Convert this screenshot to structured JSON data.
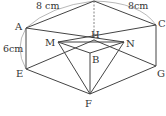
{
  "figure": {
    "type": "geometry-diagram",
    "points": {
      "A": {
        "label": "A",
        "x": 26,
        "y": 28
      },
      "C": {
        "label": "C",
        "x": 156,
        "y": 25
      },
      "E": {
        "label": "E",
        "x": 26,
        "y": 69
      },
      "G": {
        "label": "G",
        "x": 156,
        "y": 66
      },
      "F": {
        "label": "F",
        "x": 90,
        "y": 94
      },
      "H": {
        "label": "H",
        "x": 94,
        "y": 40
      },
      "B": {
        "label": "B",
        "x": 90,
        "y": 53
      },
      "M": {
        "label": "M",
        "x": 58,
        "y": 42
      },
      "N": {
        "label": "N",
        "x": 124,
        "y": 42
      },
      "T": {
        "label": "",
        "x": 94,
        "y": 1
      }
    },
    "dimensions": {
      "top_left": "8 cm",
      "top_right": "8cm",
      "left_side": "6cm"
    }
  }
}
